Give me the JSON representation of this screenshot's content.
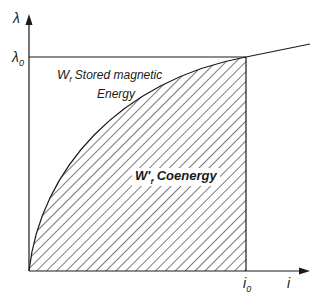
{
  "diagram": {
    "axes": {
      "y_label": "λ",
      "x_label": "i",
      "y_tick": {
        "main": "λ",
        "sub": "0"
      },
      "x_tick": {
        "main": "i",
        "sub": "0"
      }
    },
    "regions": {
      "stored_energy": {
        "symbol": "W",
        "sub": "f",
        "label_line1": " Stored magnetic",
        "label_line2": "Energy"
      },
      "coenergy": {
        "symbol": "W'",
        "sub": "f",
        "label": " Coenergy"
      }
    },
    "colors": {
      "line": "#1a1a1a",
      "hatch": "#333333",
      "background": "#ffffff"
    }
  }
}
